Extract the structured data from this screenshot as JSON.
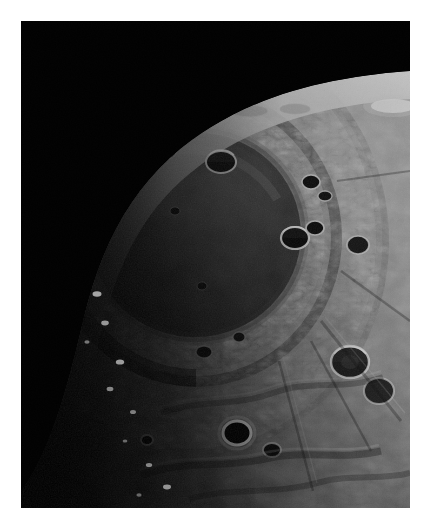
{
  "document": {
    "kind": "photograph",
    "subject": "Moon",
    "background_color": "#ffffff",
    "page_width": 426,
    "page_height": 527
  },
  "photo": {
    "name": "lunar-impact-basin-photo",
    "frame": {
      "x": 21,
      "y": 21,
      "width": 389,
      "height": 487
    },
    "space_color": "#010101",
    "terminator_color": "#050505",
    "mare_floor_color": "#2e2e2e",
    "mare_inner_color": "#262626",
    "highland_color": "#7c7c7c",
    "highland_bright_color": "#a8a8a8",
    "rim_highlight_color": "#d6d6d6",
    "shadow_color": "#0a0a0a",
    "limb_glow_color": "#c9c9c9",
    "orientation": "portrait",
    "lighting": "low sun angle from upper right, terminator on left",
    "scene": {
      "description": "Oblique view of a large multi-ring lunar impact basin near the terminator, with a dark flooded mare interior, a rugged encircling mountain ring, and cratered highlands curving to the limb against black space.",
      "limb": {
        "name": "planet-limb",
        "curve_points": [
          [
            0.12,
            1.02
          ],
          [
            0.3,
            0.6
          ],
          [
            0.5,
            0.38
          ],
          [
            0.72,
            0.26
          ],
          [
            1.0,
            0.21
          ]
        ]
      },
      "mare_basin": {
        "name": "mare-basin",
        "center_x": 0.45,
        "center_y": 0.44,
        "radius_x": 0.27,
        "radius_y": 0.21,
        "rotation_deg": -12
      },
      "inner_ring": {
        "name": "inner-mountain-ring",
        "center_x": 0.45,
        "center_y": 0.44,
        "radius_x": 0.37,
        "radius_y": 0.31
      },
      "outer_ring": {
        "name": "outer-mountain-ring",
        "center_x": 0.44,
        "center_y": 0.45,
        "radius_x": 0.5,
        "radius_y": 0.44
      }
    },
    "craters": [
      {
        "name": "crater-mare-north-rim",
        "cx": 0.515,
        "cy": 0.29,
        "r": 0.035,
        "shadow": "left",
        "bright": 0.75
      },
      {
        "name": "crater-mare-northwest",
        "cx": 0.37,
        "cy": 0.27,
        "r": 0.024,
        "shadow": "left",
        "bright": 0.62
      },
      {
        "name": "crater-mare-interior-a",
        "cx": 0.395,
        "cy": 0.39,
        "r": 0.013,
        "shadow": "left",
        "bright": 0.4
      },
      {
        "name": "crater-mare-interior-b",
        "cx": 0.465,
        "cy": 0.545,
        "r": 0.012,
        "shadow": "left",
        "bright": 0.38
      },
      {
        "name": "crater-basin-east-a",
        "cx": 0.745,
        "cy": 0.33,
        "r": 0.02,
        "shadow": "left",
        "bright": 0.8
      },
      {
        "name": "crater-basin-east-b",
        "cx": 0.78,
        "cy": 0.36,
        "r": 0.016,
        "shadow": "left",
        "bright": 0.78
      },
      {
        "name": "crater-ring-east-pair-a",
        "cx": 0.705,
        "cy": 0.445,
        "r": 0.03,
        "shadow": "left",
        "bright": 0.82
      },
      {
        "name": "crater-ring-east-pair-b",
        "cx": 0.755,
        "cy": 0.425,
        "r": 0.022,
        "shadow": "left",
        "bright": 0.76
      },
      {
        "name": "crater-highland-east",
        "cx": 0.865,
        "cy": 0.46,
        "r": 0.026,
        "shadow": "left",
        "bright": 0.7
      },
      {
        "name": "crater-highland-large",
        "cx": 0.845,
        "cy": 0.7,
        "r": 0.04,
        "shadow": "left",
        "bright": 0.74
      },
      {
        "name": "crater-highland-lower",
        "cx": 0.92,
        "cy": 0.76,
        "r": 0.033,
        "shadow": "left",
        "bright": 0.66
      },
      {
        "name": "crater-south-bright",
        "cx": 0.555,
        "cy": 0.845,
        "r": 0.03,
        "shadow": "full",
        "bright": 0.95
      },
      {
        "name": "crater-south-small",
        "cx": 0.325,
        "cy": 0.86,
        "r": 0.014,
        "shadow": "full",
        "bright": 0.72
      },
      {
        "name": "crater-south-east",
        "cx": 0.645,
        "cy": 0.88,
        "r": 0.02,
        "shadow": "left",
        "bright": 0.6
      },
      {
        "name": "crater-limb-north",
        "cx": 0.585,
        "cy": 0.185,
        "r": 0.026,
        "shadow": "flat",
        "bright": 0.58
      },
      {
        "name": "crater-limb-northeast",
        "cx": 0.705,
        "cy": 0.18,
        "r": 0.022,
        "shadow": "flat",
        "bright": 0.55
      },
      {
        "name": "crater-ring-south-a",
        "cx": 0.47,
        "cy": 0.68,
        "r": 0.018,
        "shadow": "left",
        "bright": 0.55
      },
      {
        "name": "crater-ring-south-b",
        "cx": 0.56,
        "cy": 0.65,
        "r": 0.015,
        "shadow": "left",
        "bright": 0.52
      }
    ],
    "terminator_peaks": [
      {
        "name": "sunlit-peak-1",
        "cx": 0.09,
        "cy": 0.345,
        "r": 0.014
      },
      {
        "name": "sunlit-peak-2",
        "cx": 0.12,
        "cy": 0.32,
        "r": 0.01
      },
      {
        "name": "sunlit-peak-3",
        "cx": 0.15,
        "cy": 0.37,
        "r": 0.008
      },
      {
        "name": "sunlit-peak-4",
        "cx": 0.1,
        "cy": 0.43,
        "r": 0.007
      },
      {
        "name": "sunlit-peak-5",
        "cx": 0.165,
        "cy": 0.415,
        "r": 0.009
      },
      {
        "name": "sunlit-peak-6",
        "cx": 0.06,
        "cy": 0.47,
        "r": 0.006
      },
      {
        "name": "sunlit-peak-7",
        "cx": 0.135,
        "cy": 0.52,
        "r": 0.008
      },
      {
        "name": "sunlit-peak-8",
        "cx": 0.195,
        "cy": 0.56,
        "r": 0.012
      },
      {
        "name": "sunlit-peak-9",
        "cx": 0.215,
        "cy": 0.62,
        "r": 0.01
      },
      {
        "name": "sunlit-peak-10",
        "cx": 0.17,
        "cy": 0.66,
        "r": 0.007
      },
      {
        "name": "sunlit-peak-11",
        "cx": 0.255,
        "cy": 0.7,
        "r": 0.011
      },
      {
        "name": "sunlit-peak-12",
        "cx": 0.23,
        "cy": 0.755,
        "r": 0.009
      }
    ],
    "limb_highlight": {
      "name": "limb-bright-highlight",
      "cx": 0.955,
      "cy": 0.175,
      "rx": 0.055,
      "ry": 0.018
    }
  }
}
